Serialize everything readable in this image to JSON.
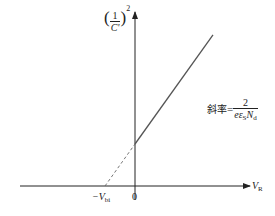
{
  "diagram": {
    "y_axis_label": {
      "paren_open": "(",
      "numerator": "1",
      "denominator": "C'",
      "paren_close": ")",
      "exponent": "2"
    },
    "x_axis_label": {
      "main": "V",
      "sub": "R"
    },
    "origin_label": "0",
    "intercept_label": {
      "main": "−V",
      "sub": "bi"
    },
    "slope_label": {
      "prefix": "斜率",
      "equals": "=",
      "numerator": "2",
      "denominator_main": "eε",
      "denominator_sub1": "S",
      "denominator_mid": "N",
      "denominator_sub2": "d"
    }
  },
  "chart_data": {
    "type": "line",
    "title": "",
    "xlabel": "V_R",
    "ylabel": "(1/C')^2",
    "annotations": [
      "-V_bi",
      "0",
      "斜率 = 2/(e ε_S N_d)"
    ],
    "series": [
      {
        "name": "extrapolation",
        "style": "dashed",
        "x": [
          -1,
          0
        ],
        "y": [
          0,
          1
        ]
      },
      {
        "name": "measured",
        "style": "solid",
        "x": [
          0,
          2.6
        ],
        "y": [
          1,
          3.6
        ]
      }
    ],
    "xlim": [
      -3.4,
      5.2
    ],
    "ylim": [
      -0.4,
      4.0
    ],
    "grid": false
  }
}
